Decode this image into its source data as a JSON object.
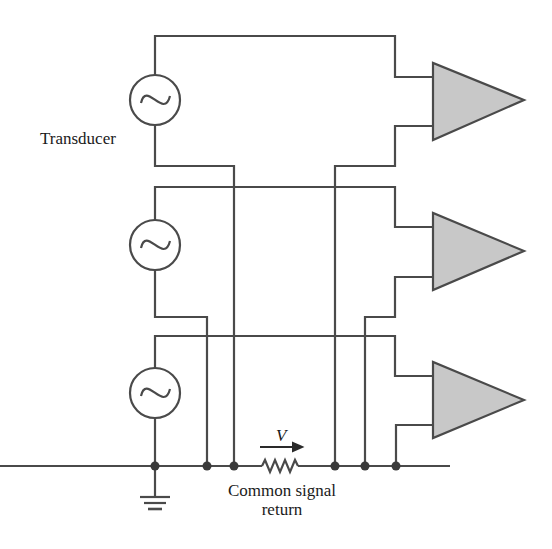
{
  "diagram": {
    "type": "circuit-schematic",
    "colors": {
      "wire": "#4a4a4a",
      "amplifier_fill": "#c8c8c8",
      "background": "#ffffff"
    },
    "labels": {
      "transducer": "Transducer",
      "voltage": "V",
      "common_return_line1": "Common signal",
      "common_return_line2": "return"
    },
    "sources": [
      {
        "name": "source-1",
        "symbol": "ac-sine-source"
      },
      {
        "name": "source-2",
        "symbol": "ac-sine-source"
      },
      {
        "name": "source-3",
        "symbol": "ac-sine-source"
      }
    ],
    "amplifiers": [
      {
        "name": "amplifier-1",
        "symbol": "triangle"
      },
      {
        "name": "amplifier-2",
        "symbol": "triangle"
      },
      {
        "name": "amplifier-3",
        "symbol": "triangle"
      }
    ],
    "common_return": {
      "components": [
        "resistor",
        "ground",
        "junction-dots"
      ],
      "junction_count": 6
    }
  }
}
